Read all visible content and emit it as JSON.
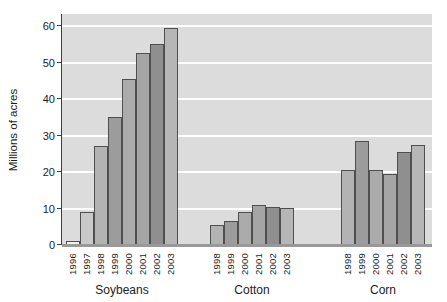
{
  "chart_data": {
    "type": "bar",
    "title": "",
    "ylabel": "Millions of acres",
    "xlabel": "",
    "ylim": [
      0,
      60
    ],
    "yticks": [
      0,
      10,
      20,
      30,
      40,
      50,
      60
    ],
    "grid": "horizontal white gridlines on light-gray plot background",
    "legend": "none",
    "groups": [
      {
        "label": "Soybeans",
        "categories": [
          "1996",
          "1997",
          "1998",
          "1999",
          "2000",
          "2001",
          "2002",
          "2003"
        ],
        "values": [
          1,
          9,
          27,
          35,
          45.5,
          52.5,
          55,
          59.5
        ]
      },
      {
        "label": "Cotton",
        "categories": [
          "1998",
          "1999",
          "2000",
          "2001",
          "2002",
          "2003"
        ],
        "values": [
          5.5,
          6.5,
          9,
          11,
          10.5,
          10
        ]
      },
      {
        "label": "Corn",
        "categories": [
          "1998",
          "1999",
          "2000",
          "2001",
          "2002",
          "2003"
        ],
        "values": [
          20.5,
          28.5,
          20.5,
          19.5,
          25.5,
          27.5
        ]
      }
    ],
    "bar_colors_by_year": {
      "1996": "#f1f1ef",
      "1997": "#c9c9c9",
      "1998": "#b3b3b3",
      "1999": "#9c9c9c",
      "2000": "#ababab",
      "2001": "#a5a5a5",
      "2002": "#8f8f8f",
      "2003": "#b6b6b6"
    }
  },
  "colors": {
    "page_bg": "#ffffff",
    "plot_bg": "#dcdcdc",
    "gridline": "#ffffff",
    "x_baseline": "#999999",
    "axis_line": "#3f3f3f",
    "bar_border": "#4f4f4f",
    "text": "#1c1c1c"
  }
}
